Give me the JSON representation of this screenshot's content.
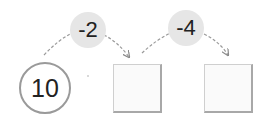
{
  "diagram": {
    "start_value": "10",
    "steps": [
      {
        "operation": "-2",
        "result": ""
      },
      {
        "operation": "-4",
        "result": ""
      }
    ]
  },
  "colors": {
    "bubble_fill": "#e6e6e6",
    "circle_border": "#9a9a9a",
    "box_border": "#a8a8a8",
    "arrow": "#9a9a9a"
  }
}
